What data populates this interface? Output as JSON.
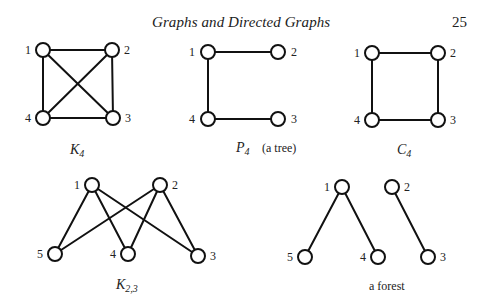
{
  "header": {
    "title": "Graphs and Directed Graphs",
    "page_number": "25"
  },
  "figures": {
    "k4": {
      "caption_main": "K",
      "caption_sub": "4",
      "vertices": [
        {
          "label": "1",
          "x": 43,
          "y": 50
        },
        {
          "label": "2",
          "x": 112,
          "y": 50
        },
        {
          "label": "3",
          "x": 113,
          "y": 118
        },
        {
          "label": "4",
          "x": 43,
          "y": 118
        }
      ],
      "edges": [
        [
          "1",
          "2"
        ],
        [
          "2",
          "3"
        ],
        [
          "3",
          "4"
        ],
        [
          "4",
          "1"
        ],
        [
          "1",
          "3"
        ],
        [
          "2",
          "4"
        ]
      ]
    },
    "p4": {
      "caption_main": "P",
      "caption_sub": "4",
      "caption_note": "(a tree)",
      "vertices": [
        {
          "label": "1",
          "x": 208,
          "y": 52
        },
        {
          "label": "2",
          "x": 278,
          "y": 52
        },
        {
          "label": "3",
          "x": 278,
          "y": 119
        },
        {
          "label": "4",
          "x": 208,
          "y": 119
        }
      ],
      "edges": [
        [
          "2",
          "1"
        ],
        [
          "1",
          "4"
        ],
        [
          "4",
          "3"
        ]
      ]
    },
    "c4": {
      "caption_main": "C",
      "caption_sub": "4",
      "vertices": [
        {
          "label": "1",
          "x": 372,
          "y": 53
        },
        {
          "label": "2",
          "x": 438,
          "y": 53
        },
        {
          "label": "3",
          "x": 438,
          "y": 120
        },
        {
          "label": "4",
          "x": 372,
          "y": 120
        }
      ],
      "edges": [
        [
          "1",
          "2"
        ],
        [
          "2",
          "3"
        ],
        [
          "3",
          "4"
        ],
        [
          "4",
          "1"
        ]
      ]
    },
    "k23": {
      "caption_main": "K",
      "caption_sub": "2,3",
      "vertices": [
        {
          "label": "1",
          "x": 92,
          "y": 185
        },
        {
          "label": "2",
          "x": 160,
          "y": 185
        },
        {
          "label": "3",
          "x": 198,
          "y": 256
        },
        {
          "label": "4",
          "x": 128,
          "y": 254
        },
        {
          "label": "5",
          "x": 55,
          "y": 254
        }
      ],
      "edges": [
        [
          "1",
          "5"
        ],
        [
          "1",
          "4"
        ],
        [
          "1",
          "3"
        ],
        [
          "2",
          "5"
        ],
        [
          "2",
          "4"
        ],
        [
          "2",
          "3"
        ]
      ]
    },
    "forest": {
      "caption": "a forest",
      "vertices": [
        {
          "label": "1",
          "x": 342,
          "y": 187
        },
        {
          "label": "2",
          "x": 392,
          "y": 187
        },
        {
          "label": "3",
          "x": 428,
          "y": 257
        },
        {
          "label": "4",
          "x": 378,
          "y": 257
        },
        {
          "label": "5",
          "x": 305,
          "y": 257
        }
      ],
      "edges": [
        [
          "1",
          "5"
        ],
        [
          "1",
          "4"
        ],
        [
          "2",
          "3"
        ]
      ]
    }
  }
}
